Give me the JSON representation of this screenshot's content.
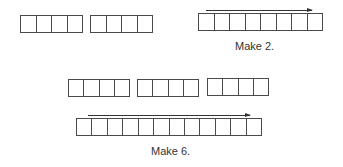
{
  "problems": [
    {
      "id": "make-2",
      "caption": "Make 2.",
      "groups": [
        {
          "cells": 4
        },
        {
          "cells": 4
        }
      ],
      "combined": {
        "cells": 8,
        "arrow": "right"
      }
    },
    {
      "id": "make-6",
      "caption": "Make 6.",
      "groups": [
        {
          "cells": 4
        },
        {
          "cells": 4
        },
        {
          "cells": 4
        }
      ],
      "combined": {
        "cells": 12,
        "arrow": "right"
      }
    }
  ],
  "colors": {
    "line": "#4a4a4a",
    "text": "#333333",
    "background": "#ffffff"
  }
}
